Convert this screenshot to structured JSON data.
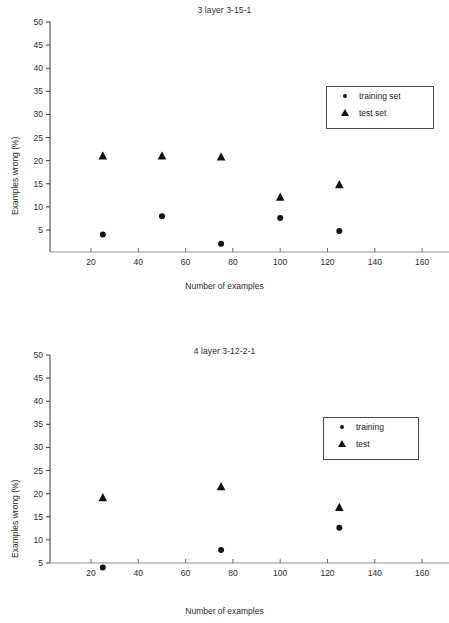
{
  "figure": {
    "background": "#ffffff",
    "marker_color": "#121212",
    "axis_color": "#3a3a3a"
  },
  "chart_data": [
    {
      "type": "scatter",
      "title": "3 layer 3-15-1",
      "xlabel": "Number of examples",
      "ylabel": "Examples wrong (%)",
      "xlim": [
        0,
        178
      ],
      "ylim": [
        0,
        50
      ],
      "xticks": [
        20,
        40,
        60,
        80,
        100,
        120,
        140,
        160
      ],
      "yticks": [
        5,
        10,
        15,
        20,
        25,
        30,
        35,
        40,
        45,
        50
      ],
      "grid": false,
      "legend_position": "upper right",
      "series": [
        {
          "name": "training set",
          "marker": "circle",
          "x": [
            25,
            50,
            75,
            100,
            125
          ],
          "y": [
            4.0,
            8.0,
            2.0,
            7.6,
            4.8
          ]
        },
        {
          "name": "test set",
          "marker": "triangle",
          "x": [
            25,
            50,
            75,
            100,
            125
          ],
          "y": [
            21.0,
            21.0,
            20.8,
            12.1,
            14.8
          ]
        }
      ]
    },
    {
      "type": "scatter",
      "title": "4 layer 3-12-2-1",
      "xlabel": "Number of examples",
      "ylabel": "Examples wrong (%)",
      "xlim": [
        0,
        178
      ],
      "ylim": [
        0,
        50
      ],
      "xticks": [
        20,
        40,
        60,
        80,
        100,
        120,
        140,
        160
      ],
      "yticks": [
        5,
        10,
        15,
        20,
        25,
        30,
        35,
        40,
        45,
        50
      ],
      "grid": false,
      "legend_position": "upper right",
      "series": [
        {
          "name": "training",
          "marker": "circle",
          "x": [
            25,
            75,
            125,
            175
          ],
          "y": [
            4.0,
            7.8,
            12.6,
            12.4
          ]
        },
        {
          "name": "test",
          "marker": "triangle",
          "x": [
            25,
            75,
            125,
            175
          ],
          "y": [
            19.1,
            21.5,
            17.0,
            20.5
          ]
        }
      ]
    }
  ],
  "charts": [
    {
      "id": "chart-top",
      "title": "3 layer 3-15-1",
      "xlabel": "Number of examples",
      "ylabel": "Examples wrong (%)",
      "legend": [
        {
          "label": "training set",
          "symbol": "circle-marker-icon"
        },
        {
          "label": "test set",
          "symbol": "triangle-marker-icon"
        }
      ]
    },
    {
      "id": "chart-bottom",
      "title": "4 layer 3-12-2-1",
      "xlabel": "Number of examples",
      "ylabel": "Examples wrong (%)",
      "legend": [
        {
          "label": "training",
          "symbol": "circle-marker-icon"
        },
        {
          "label": "test",
          "symbol": "triangle-marker-icon"
        }
      ]
    }
  ]
}
